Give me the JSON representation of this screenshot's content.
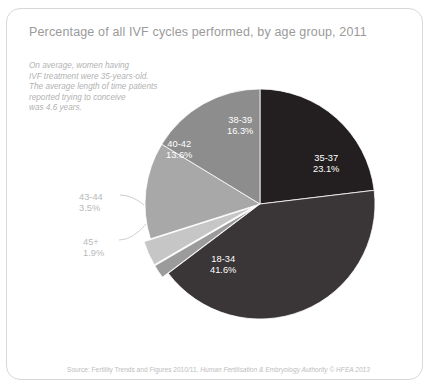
{
  "card": {
    "title": "Percentage of all IVF cycles performed, by age group, 2011",
    "annotation": [
      "On average, women having",
      "IVF treatment were 35-years-old.",
      "The average length of time patients",
      "reported trying to conceive",
      "was 4.6 years."
    ],
    "source_prefix": "Source: Fertility Trends and Figures 2010/11, ",
    "source_italic": "Human Fertilisation & Embryology Authority © HFEA 2013"
  },
  "chart_data": {
    "type": "pie",
    "title": "Percentage of all IVF cycles performed, by age group, 2011",
    "unit": "%",
    "legend_position": "none",
    "labels_on_slices": true,
    "categories": [
      "35-37",
      "18-34",
      "45+",
      "43-44",
      "40-42",
      "38-39"
    ],
    "values": [
      23.1,
      41.6,
      1.9,
      3.5,
      13.6,
      16.3
    ],
    "slices": [
      {
        "name": "35-37",
        "value": 23.1,
        "value_label": "23.1%",
        "color": "#231f20",
        "label_placement": "inside",
        "label_color": "#ffffff",
        "label_x": 306,
        "label_y": 144,
        "start_angle_deg": 0,
        "end_angle_deg": 83.16
      },
      {
        "name": "18-34",
        "value": 41.6,
        "value_label": "41.6%",
        "color": "#3a3536",
        "label_placement": "inside",
        "label_color": "#ffffff",
        "label_x": 203,
        "label_y": 245,
        "start_angle_deg": 83.16,
        "end_angle_deg": 232.92
      },
      {
        "name": "45+",
        "value": 1.9,
        "value_label": "1.9%",
        "color": "#9b9b9b",
        "label_placement": "outside",
        "label_color": "#b9b9b9",
        "label_x": 76,
        "label_y": 228,
        "start_angle_deg": 232.92,
        "end_angle_deg": 239.76
      },
      {
        "name": "43-44",
        "value": 3.5,
        "value_label": "3.5%",
        "color": "#c6c6c6",
        "label_placement": "outside",
        "label_color": "#b9b9b9",
        "label_x": 72,
        "label_y": 183,
        "start_angle_deg": 239.76,
        "end_angle_deg": 252.36
      },
      {
        "name": "40-42",
        "value": 13.6,
        "value_label": "13.6%",
        "color": "#a8a8a8",
        "label_placement": "inside",
        "label_color": "#ffffff",
        "label_x": 159,
        "label_y": 130,
        "start_angle_deg": 252.36,
        "end_angle_deg": 301.32
      },
      {
        "name": "38-39",
        "value": 16.3,
        "value_label": "16.3%",
        "color": "#8d8d8d",
        "label_placement": "inside",
        "label_color": "#ffffff",
        "label_x": 220,
        "label_y": 106,
        "start_angle_deg": 301.32,
        "end_angle_deg": 360
      }
    ],
    "geometry": {
      "center_x": 253,
      "center_y": 195,
      "radius": 115
    }
  }
}
